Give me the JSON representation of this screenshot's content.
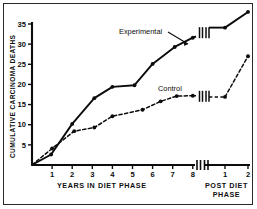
{
  "chart_data": {
    "type": "line",
    "title": "",
    "subtitle": "",
    "ylabel": "CUMULATIVE CARCINOMA DEATHS",
    "xlabel": "YEARS IN DIET PHASE",
    "xlabel_secondary_line1": "POST DIET",
    "xlabel_secondary_line2": "PHASE",
    "ylim": [
      0,
      39
    ],
    "yticks": [
      5,
      10,
      15,
      20,
      25,
      30,
      35
    ],
    "xticks_diet": [
      1,
      2,
      3,
      4,
      5,
      6,
      7,
      8
    ],
    "xticks_post": [
      1,
      2
    ],
    "axis_break": true,
    "grid": false,
    "legend_position": "inline-annotation",
    "series": [
      {
        "name": "Experimental",
        "style": "solid",
        "color": "#0c0c0c",
        "marker": "filled-circle",
        "points": [
          {
            "x": 0.0,
            "y": 0.0,
            "phase": "diet"
          },
          {
            "x": 0.95,
            "y": 2.6,
            "phase": "diet"
          },
          {
            "x": 2.0,
            "y": 10.2,
            "phase": "diet"
          },
          {
            "x": 3.1,
            "y": 16.6,
            "phase": "diet"
          },
          {
            "x": 4.0,
            "y": 19.4,
            "phase": "diet"
          },
          {
            "x": 5.1,
            "y": 19.8,
            "phase": "diet"
          },
          {
            "x": 6.0,
            "y": 25.1,
            "phase": "diet"
          },
          {
            "x": 7.1,
            "y": 29.3,
            "phase": "diet"
          },
          {
            "x": 8.0,
            "y": 31.6,
            "phase": "diet"
          },
          {
            "x": 1.0,
            "y": 34.1,
            "phase": "post"
          },
          {
            "x": 2.0,
            "y": 38.0,
            "phase": "post"
          }
        ]
      },
      {
        "name": "Control",
        "style": "dashed",
        "color": "#0c0c0c",
        "marker": "filled-circle",
        "points": [
          {
            "x": 0.0,
            "y": 0.0,
            "phase": "diet"
          },
          {
            "x": 1.0,
            "y": 4.1,
            "phase": "diet"
          },
          {
            "x": 2.1,
            "y": 8.4,
            "phase": "diet"
          },
          {
            "x": 3.1,
            "y": 9.3,
            "phase": "diet"
          },
          {
            "x": 4.0,
            "y": 12.1,
            "phase": "diet"
          },
          {
            "x": 5.5,
            "y": 13.7,
            "phase": "diet"
          },
          {
            "x": 6.4,
            "y": 15.8,
            "phase": "diet"
          },
          {
            "x": 7.2,
            "y": 17.1,
            "phase": "diet"
          },
          {
            "x": 8.0,
            "y": 17.2,
            "phase": "diet"
          },
          {
            "x": 1.0,
            "y": 16.9,
            "phase": "post"
          },
          {
            "x": 2.0,
            "y": 27.0,
            "phase": "post"
          }
        ]
      }
    ],
    "annotations": [
      {
        "name": "experimental-label",
        "text": "Experimental"
      },
      {
        "name": "control-label",
        "text": "Control"
      }
    ]
  },
  "ytick_labels": [
    "5",
    "10",
    "15",
    "20",
    "25",
    "30",
    "35"
  ],
  "xtick_labels_diet": [
    "1",
    "2",
    "3",
    "4",
    "5",
    "6",
    "7",
    "8"
  ],
  "xtick_labels_post": [
    "1",
    "2"
  ]
}
